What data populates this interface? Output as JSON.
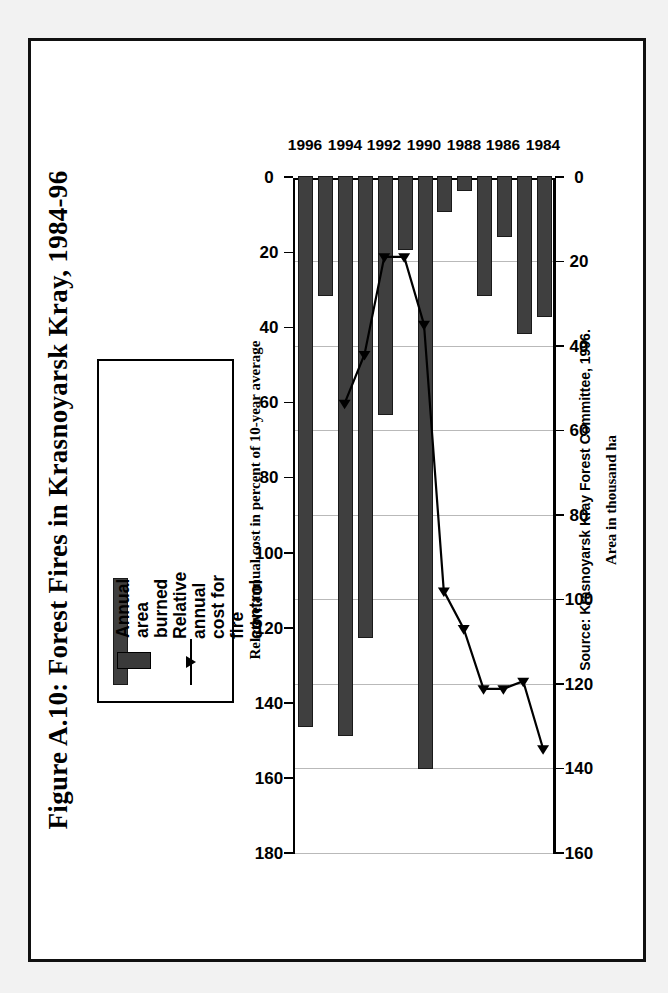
{
  "figure": {
    "title": "Figure A.10: Forest Fires in Krasnoyarsk Kray, 1984-96",
    "source": "Source: Krasnoyarsk Kray Forest Committee, 1996."
  },
  "legend": {
    "position": "top-right",
    "items": [
      {
        "label": "Annual\narea\nburned",
        "type": "bar",
        "color": "#3f3f3f"
      },
      {
        "label": "Relative\nannual\ncost for\nfire\ncontrol",
        "type": "line",
        "color": "#000000"
      }
    ]
  },
  "axes": {
    "primary": {
      "title": "Area in thousand ha",
      "ticks": [
        "0",
        "20",
        "40",
        "60",
        "80",
        "100",
        "120",
        "140",
        "160"
      ],
      "min": 0,
      "max": 160
    },
    "secondary": {
      "title": "Relative annual cost in percent of 10-year average",
      "ticks": [
        "0",
        "20",
        "40",
        "60",
        "80",
        "100",
        "120",
        "140",
        "160",
        "180"
      ],
      "min": 0,
      "max": 180
    },
    "category": {
      "labels": [
        "1984",
        "1986",
        "1988",
        "1990",
        "1992",
        "1994",
        "1996"
      ]
    }
  },
  "chart_data": {
    "type": "bar",
    "title": "Figure A.10: Forest Fires in Krasnoyarsk Kray, 1984-96",
    "xlabel": "",
    "ylabel": "Area in thousand ha",
    "y2label": "Relative annual cost in percent of 10-year average",
    "categories": [
      "1984",
      "1985",
      "1986",
      "1987",
      "1988",
      "1989",
      "1990",
      "1991",
      "1992",
      "1993",
      "1994",
      "1995",
      "1996"
    ],
    "ylim": [
      0,
      160
    ],
    "y2lim": [
      0,
      180
    ],
    "grid": true,
    "orientation": "horizontal-printed-sideways",
    "series": [
      {
        "name": "Annual area burned",
        "type": "bar",
        "unit": "thousand ha",
        "axis": "primary",
        "color": "#3f3f3f",
        "values": [
          33,
          37,
          14,
          28,
          3,
          8,
          140,
          17,
          56,
          109,
          132,
          28,
          130
        ]
      },
      {
        "name": "Relative annual cost for fire control",
        "type": "line",
        "unit": "percent of 10-year average",
        "axis": "secondary",
        "color": "#000000",
        "values": [
          152,
          134,
          136,
          136,
          120,
          110,
          39,
          21,
          21,
          47,
          60,
          null,
          null
        ]
      }
    ]
  }
}
